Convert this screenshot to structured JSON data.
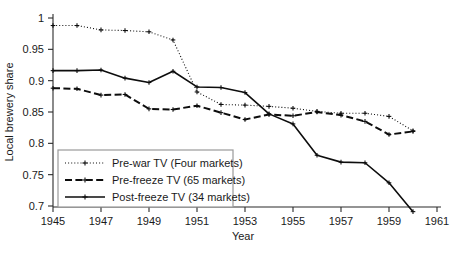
{
  "chart_data": {
    "type": "line",
    "title": "",
    "xlabel": "Year",
    "ylabel": "Local brewery share",
    "xlim": [
      1945,
      1961
    ],
    "ylim": [
      0.7,
      1.0
    ],
    "xticks": [
      1945,
      1947,
      1949,
      1951,
      1953,
      1955,
      1957,
      1959,
      1961
    ],
    "xtick_labels": [
      "1945",
      "1947",
      "1949",
      "1951",
      "1953",
      "1955",
      "1957",
      "1959",
      "1961"
    ],
    "yticks": [
      0.7,
      0.75,
      0.8,
      0.85,
      0.9,
      0.95,
      1.0
    ],
    "ytick_labels": [
      "0.7",
      "0.75",
      "0.8",
      "0.85",
      "0.9",
      "0.95",
      "1"
    ],
    "grid": false,
    "legend_position": "lower-left-inside",
    "x": [
      1945,
      1946,
      1947,
      1948,
      1949,
      1950,
      1951,
      1952,
      1953,
      1954,
      1955,
      1956,
      1957,
      1958,
      1959,
      1960
    ],
    "series": [
      {
        "name": "Pre-war TV (Four markets)",
        "linestyle": "dotted",
        "marker": "plus",
        "color": "#0d0d0d",
        "values": [
          0.988,
          0.988,
          0.981,
          0.98,
          0.978,
          0.965,
          0.882,
          0.862,
          0.861,
          0.859,
          0.856,
          0.851,
          0.848,
          0.848,
          0.843,
          0.82
        ]
      },
      {
        "name": "Pre-freeze TV (65 markets)",
        "linestyle": "dashed",
        "marker": "plus",
        "color": "#0d0d0d",
        "values": [
          0.888,
          0.887,
          0.877,
          0.878,
          0.855,
          0.854,
          0.86,
          0.849,
          0.838,
          0.846,
          0.844,
          0.85,
          0.845,
          0.835,
          0.814,
          0.819
        ]
      },
      {
        "name": "Post-freeze TV (34 markets)",
        "linestyle": "solid",
        "marker": "plus",
        "color": "#0d0d0d",
        "values": [
          0.916,
          0.916,
          0.917,
          0.904,
          0.897,
          0.915,
          0.89,
          0.889,
          0.881,
          0.847,
          0.831,
          0.781,
          0.77,
          0.769,
          0.737,
          0.691
        ]
      }
    ]
  },
  "legend": {
    "items": [
      {
        "label": "Pre-war TV (Four markets)"
      },
      {
        "label": "Pre-freeze TV (65 markets)"
      },
      {
        "label": "Post-freeze TV (34 markets)"
      }
    ]
  },
  "axes": {
    "y_title": "Local brewery share",
    "x_title": "Year"
  }
}
